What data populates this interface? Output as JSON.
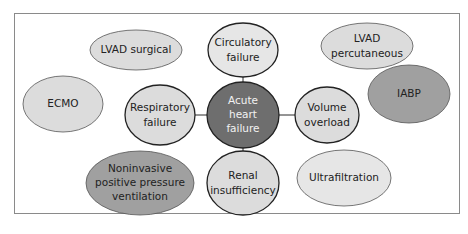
{
  "diagram": {
    "colors": {
      "light": "#dcdcdc",
      "medium": "#a0a0a0",
      "dark": "#6e6e6e",
      "stroke": "#2a2a2a",
      "text_dark": "#222222",
      "text_light": "#f2f2f2",
      "frame": "#8a8a8a"
    },
    "center": {
      "id": "acute-heart-failure",
      "lines": [
        "Acute",
        "heart",
        "failure"
      ]
    },
    "connected_nodes": [
      {
        "id": "circulatory-failure",
        "lines": [
          "Circulatory",
          "failure"
        ]
      },
      {
        "id": "respiratory-failure",
        "lines": [
          "Respiratory",
          "failure"
        ]
      },
      {
        "id": "volume-overload",
        "lines": [
          "Volume",
          "overload"
        ]
      },
      {
        "id": "renal-insufficiency",
        "lines": [
          "Renal",
          "insufficiency"
        ]
      }
    ],
    "therapy_nodes": [
      {
        "id": "lvad-surgical",
        "lines": [
          "LVAD surgical"
        ]
      },
      {
        "id": "lvad-percutaneous",
        "lines": [
          "LVAD",
          "percutaneous"
        ]
      },
      {
        "id": "ecmo",
        "lines": [
          "ECMO"
        ]
      },
      {
        "id": "iabp",
        "lines": [
          "IABP"
        ]
      },
      {
        "id": "nippv",
        "lines": [
          "Noninvasive",
          "positive pressure",
          "ventilation"
        ]
      },
      {
        "id": "ultrafiltration",
        "lines": [
          "Ultrafiltration"
        ]
      }
    ]
  }
}
